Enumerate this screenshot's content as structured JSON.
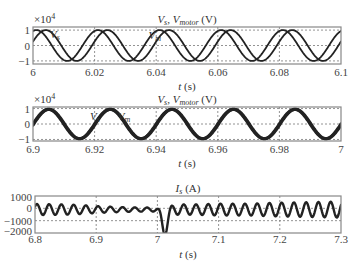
{
  "chart_data": [
    {
      "type": "line",
      "title": "V_s, V_motor (V)",
      "title_main": "V",
      "title_parts": [
        "V",
        "s",
        ", V",
        "motor",
        " (V)"
      ],
      "xlabel": "t (s)",
      "ylabel": "",
      "y_multiplier": "×10^4",
      "xlim": [
        6,
        6.1
      ],
      "ylim": [
        -1.2,
        1.2
      ],
      "xticks": [
        6,
        6.02,
        6.04,
        6.06,
        6.08,
        6.1
      ],
      "xtick_labels": [
        "6",
        "6.02",
        "6.04",
        "6.06",
        "6.08",
        "6.1"
      ],
      "yticks": [
        1,
        0,
        -1
      ],
      "ytick_labels": [
        "1",
        "0",
        "−1"
      ],
      "grid": true,
      "annotations": [
        {
          "text": "V",
          "sub": "s",
          "t": 6.0055,
          "y": 0.75
        },
        {
          "text": "V",
          "sub": "m",
          "t": 6.0375,
          "y": 0.7
        }
      ],
      "series": [
        {
          "name": "V_s",
          "kind": "sine",
          "amplitude": 1.0,
          "frequency_hz": 50,
          "phase_deg": 70,
          "stroke_width": 1.8
        },
        {
          "name": "V_m",
          "kind": "sine",
          "amplitude": 1.0,
          "frequency_hz": 50,
          "phase_deg": 15,
          "stroke_width": 1.8
        }
      ]
    },
    {
      "type": "line",
      "title": "V_s, V_motor (V)",
      "title_parts": [
        "V",
        "s",
        ", V",
        "motor",
        " (V)"
      ],
      "xlabel": "t (s)",
      "ylabel": "",
      "y_multiplier": "×10^4",
      "xlim": [
        6.9,
        7.0
      ],
      "ylim": [
        -1.1,
        1.1
      ],
      "xticks": [
        6.9,
        6.92,
        6.94,
        6.96,
        6.98,
        7.0
      ],
      "xtick_labels": [
        "6.9",
        "6.92",
        "6.94",
        "6.96",
        "6.98",
        "7"
      ],
      "yticks": [
        1,
        0,
        -1
      ],
      "ytick_labels": [
        "1",
        "0",
        "−1"
      ],
      "grid": true,
      "annotations": [
        {
          "text": "V",
          "sub": "s",
          "t": 6.9185,
          "y": 0.55
        },
        {
          "text": "V",
          "sub": "m",
          "t": 6.9275,
          "y": 0.55
        }
      ],
      "series": [
        {
          "name": "V_s",
          "kind": "sine",
          "amplitude": 0.95,
          "frequency_hz": 50,
          "phase_deg": 0,
          "stroke_width": 3.2
        },
        {
          "name": "V_m",
          "kind": "sine",
          "amplitude": 0.95,
          "frequency_hz": 50,
          "phase_deg": -4,
          "stroke_width": 3.2
        }
      ]
    },
    {
      "type": "line",
      "title": "I_s (A)",
      "title_parts": [
        "I",
        "s",
        " (A)"
      ],
      "xlabel": "t (s)",
      "ylabel": "",
      "xlim": [
        6.8,
        7.3
      ],
      "ylim": [
        -2000,
        1000
      ],
      "xticks": [
        6.8,
        6.9,
        7.0,
        7.1,
        7.2,
        7.3
      ],
      "xtick_labels": [
        "6.8",
        "6.9",
        "7",
        "7.1",
        "7.2",
        "7.3"
      ],
      "yticks": [
        1000,
        0,
        -1000,
        -2000
      ],
      "ytick_labels": [
        "1000",
        "0",
        "−1000",
        "−2000"
      ],
      "grid": true,
      "series": [
        {
          "name": "I_s",
          "kind": "envelope_sine",
          "frequency_hz": 50,
          "offset": -100,
          "stroke_width": 2.4,
          "envelope_points": [
            [
              6.8,
              450
            ],
            [
              6.85,
              420
            ],
            [
              6.88,
              350
            ],
            [
              6.9,
              280
            ],
            [
              6.93,
              220
            ],
            [
              6.96,
              180
            ],
            [
              6.99,
              160
            ],
            [
              7.0,
              150
            ],
            [
              7.03,
              420
            ],
            [
              7.06,
              420
            ],
            [
              7.1,
              480
            ],
            [
              7.15,
              480
            ],
            [
              7.2,
              560
            ],
            [
              7.25,
              600
            ],
            [
              7.3,
              650
            ]
          ],
          "transient": {
            "t_center": 7.012,
            "depth": -1850,
            "width_s": 0.006
          }
        }
      ]
    }
  ],
  "panels": [
    {
      "x": 33,
      "y": 27,
      "w": 308,
      "h": 37
    },
    {
      "x": 33,
      "y": 107,
      "w": 308,
      "h": 34
    },
    {
      "x": 35,
      "y": 196,
      "w": 306,
      "h": 37
    }
  ],
  "style": {
    "trace_color": "#222222",
    "frame_color": "#888888",
    "grid_color": "#777777",
    "text_color": "#333333"
  }
}
